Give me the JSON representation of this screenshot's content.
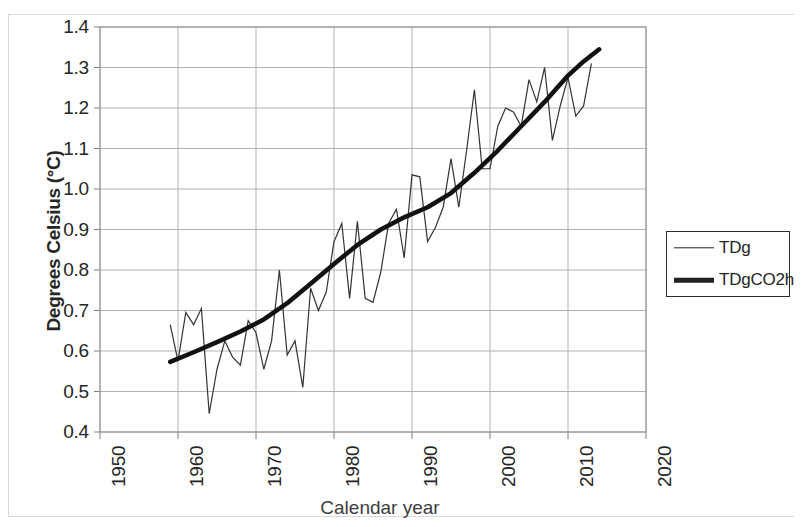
{
  "chart_data": {
    "type": "line",
    "title": "",
    "xlabel": "Calendar year",
    "ylabel": "Degrees Celsius (°C)",
    "xlim": [
      1950,
      2020
    ],
    "ylim": [
      0.4,
      1.4
    ],
    "xticks": [
      1950,
      1960,
      1970,
      1980,
      1990,
      2000,
      2010,
      2020
    ],
    "yticks": [
      0.4,
      0.5,
      0.6,
      0.7,
      0.8,
      0.9,
      1.0,
      1.1,
      1.2,
      1.3,
      1.4
    ],
    "xtick_labels": [
      "1950",
      "1960",
      "1970",
      "1980",
      "1990",
      "2000",
      "2010",
      "2020"
    ],
    "ytick_labels": [
      "0.4",
      "0.5",
      "0.6",
      "0.7",
      "0.8",
      "0.9",
      "1.0",
      "1.1",
      "1.2",
      "1.3",
      "1.4"
    ],
    "grid": true,
    "grid_color": "#b3b3b3",
    "legend_position": "right",
    "series": [
      {
        "name": "TDg",
        "style": "thin-line",
        "color": "#333333",
        "linewidth": 1.2,
        "x": [
          1959,
          1960,
          1961,
          1962,
          1963,
          1964,
          1965,
          1966,
          1967,
          1968,
          1969,
          1970,
          1971,
          1972,
          1973,
          1974,
          1975,
          1976,
          1977,
          1978,
          1979,
          1980,
          1981,
          1982,
          1983,
          1984,
          1985,
          1986,
          1987,
          1988,
          1989,
          1990,
          1991,
          1992,
          1993,
          1994,
          1995,
          1996,
          1997,
          1998,
          1999,
          2000,
          2001,
          2002,
          2003,
          2004,
          2005,
          2006,
          2007,
          2008,
          2009,
          2010,
          2011,
          2012,
          2013
        ],
        "values": [
          0.665,
          0.575,
          0.695,
          0.665,
          0.705,
          0.445,
          0.555,
          0.625,
          0.585,
          0.565,
          0.675,
          0.645,
          0.555,
          0.625,
          0.8,
          0.59,
          0.625,
          0.51,
          0.755,
          0.7,
          0.745,
          0.87,
          0.915,
          0.73,
          0.92,
          0.73,
          0.72,
          0.795,
          0.915,
          0.95,
          0.83,
          1.035,
          1.03,
          0.87,
          0.905,
          0.955,
          1.075,
          0.955,
          1.095,
          1.245,
          1.05,
          1.05,
          1.155,
          1.2,
          1.19,
          1.155,
          1.27,
          1.215,
          1.3,
          1.12,
          1.205,
          1.275,
          1.18,
          1.205,
          1.31
        ]
      },
      {
        "name": "TDgCO2h",
        "style": "thick-line",
        "color": "#111111",
        "linewidth": 4.5,
        "x": [
          1959,
          1962,
          1965,
          1968,
          1971,
          1974,
          1977,
          1980,
          1983,
          1986,
          1989,
          1992,
          1995,
          1998,
          2001,
          2004,
          2007,
          2010,
          2012,
          2014
        ],
        "values": [
          0.573,
          0.597,
          0.622,
          0.648,
          0.678,
          0.718,
          0.766,
          0.815,
          0.862,
          0.9,
          0.93,
          0.955,
          0.99,
          1.04,
          1.095,
          1.155,
          1.215,
          1.28,
          1.315,
          1.345
        ]
      }
    ]
  },
  "legend": {
    "entries": [
      {
        "label": "TDg",
        "style": "thin"
      },
      {
        "label": "TDgCO2h",
        "style": "thick"
      }
    ]
  },
  "axes": {
    "y_title": "Degrees Celsius (°C)",
    "x_title": "Calendar year"
  }
}
